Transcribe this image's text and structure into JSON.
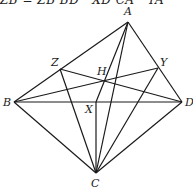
{
  "caption": "ZB = ZB BD · XD CA · YA",
  "diagram": {
    "points": {
      "A": {
        "x": 128,
        "y": 22,
        "label": "A"
      },
      "B": {
        "x": 14,
        "y": 102,
        "label": "B"
      },
      "C": {
        "x": 96,
        "y": 173,
        "label": "C"
      },
      "D": {
        "x": 182,
        "y": 102,
        "label": "D"
      },
      "Z": {
        "x": 60,
        "y": 69,
        "label": "Z"
      },
      "Y": {
        "x": 158,
        "y": 68,
        "label": "Y"
      },
      "H": {
        "x": 104,
        "y": 80,
        "label": "H"
      },
      "X": {
        "x": 96,
        "y": 102,
        "label": "X"
      }
    },
    "segments": [
      [
        "A",
        "B"
      ],
      [
        "A",
        "D"
      ],
      [
        "B",
        "D"
      ],
      [
        "B",
        "C"
      ],
      [
        "D",
        "C"
      ],
      [
        "A",
        "X"
      ],
      [
        "A",
        "C"
      ],
      [
        "Z",
        "C"
      ],
      [
        "Y",
        "C"
      ],
      [
        "X",
        "C"
      ],
      [
        "B",
        "Y"
      ],
      [
        "Z",
        "D"
      ]
    ]
  }
}
